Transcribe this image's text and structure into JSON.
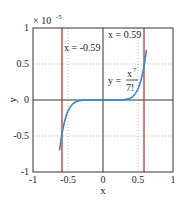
{
  "chart_data": {
    "type": "line",
    "title": "",
    "xlabel": "x",
    "ylabel": "y",
    "xlim": [
      -1,
      1
    ],
    "ylim": [
      -1,
      1
    ],
    "y_scale_factor": "× 10^-5",
    "y_scale_label": "× 10",
    "y_scale_exp": "-5",
    "xticks": [
      "-1",
      "-0.5",
      "0",
      "0.5",
      "1"
    ],
    "yticks": [
      "-1",
      "-0.5",
      "0",
      "0.5",
      "1"
    ],
    "grid": "dotted at 0.5 intervals",
    "series": [
      {
        "name": "y = x^7/7!",
        "color": "#3a86c8",
        "function": "x^7/5040",
        "x_range": [
          -0.62,
          0.62
        ]
      }
    ],
    "vertical_lines": [
      {
        "x": -0.59,
        "label": "x = -0.59",
        "color": "#c0392b"
      },
      {
        "x": 0.59,
        "label": "x = 0.59",
        "color": "#c0392b"
      }
    ],
    "annotations": [
      {
        "text": "x = -0.59"
      },
      {
        "text": "x = 0.59"
      },
      {
        "text": "y = x^7 / 7!"
      }
    ]
  },
  "labels": {
    "xlabel": "x",
    "ylabel": "y",
    "scale": "× 10",
    "scale_exp": "-5",
    "xticks": [
      "-1",
      "-0.5",
      "0",
      "0.5",
      "1"
    ],
    "yticks": [
      "1",
      "0.5",
      "0",
      "-0.5",
      "-1"
    ],
    "ann_left": "x = -0.59",
    "ann_right": "x = 0.59",
    "eq_lhs": "y =",
    "eq_num": "x",
    "eq_num_exp": "7",
    "eq_den": "7!"
  }
}
